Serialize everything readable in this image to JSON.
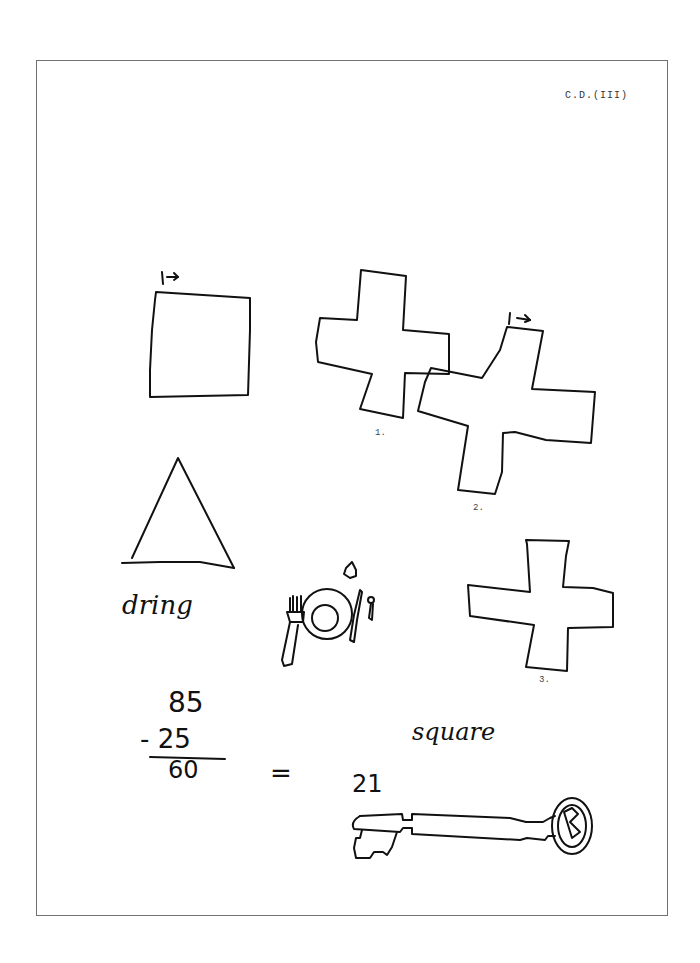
{
  "document": {
    "header_code": "C.D.(III)",
    "figure_labels": [
      "1.",
      "2.",
      "3."
    ],
    "handwritten": {
      "triangle_caption": "dring",
      "arithmetic": {
        "minuend": "85",
        "subtrahend": "- 25",
        "result": "60",
        "equals": "="
      },
      "square_word": "square",
      "key_number": "21"
    },
    "start_markers": [
      "|→",
      "|→"
    ],
    "drawings": [
      "square-copy",
      "cross-1",
      "cross-2",
      "triangle",
      "place-setting",
      "cross-3",
      "key"
    ],
    "colors": {
      "ink": "#111111",
      "frame": "#707070",
      "background": "#ffffff"
    }
  }
}
